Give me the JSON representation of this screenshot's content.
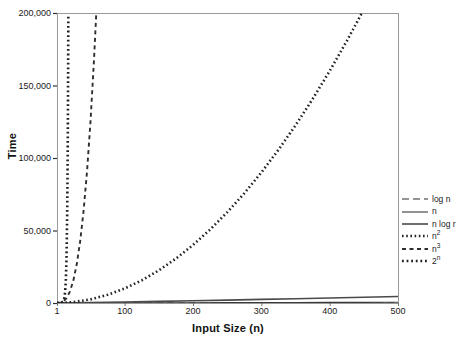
{
  "chart_data": {
    "type": "line",
    "title": "",
    "xlabel": "Input Size (n)",
    "ylabel": "Time",
    "xlim": [
      1,
      500
    ],
    "ylim": [
      0,
      200000
    ],
    "grid": false,
    "legend_position": "right",
    "x_ticks": [
      "1",
      "100",
      "200",
      "300",
      "400",
      "500"
    ],
    "x_tick_values": [
      1,
      100,
      200,
      300,
      400,
      500
    ],
    "y_ticks": [
      "0",
      "50,000",
      "100,000",
      "150,000",
      "200,000"
    ],
    "y_tick_values": [
      0,
      50000,
      100000,
      150000,
      200000
    ],
    "series": [
      {
        "name": "log n",
        "label_base": "log n",
        "label_sup": "",
        "style": "dashed-long",
        "dasharray": "7,4",
        "width": 1.2,
        "color": "#2b2b2b",
        "x": [
          1,
          10,
          25,
          50,
          100,
          150,
          200,
          250,
          300,
          350,
          400,
          450,
          500
        ],
        "y": [
          0,
          2,
          3,
          4,
          5,
          5,
          5,
          6,
          6,
          6,
          6,
          6,
          6
        ]
      },
      {
        "name": "n",
        "label_base": "n",
        "label_sup": "",
        "style": "solid",
        "dasharray": "",
        "width": 1.1,
        "color": "#3a3a3a",
        "x": [
          1,
          50,
          100,
          150,
          200,
          250,
          300,
          350,
          400,
          450,
          500
        ],
        "y": [
          1,
          50,
          100,
          150,
          200,
          250,
          300,
          350,
          400,
          450,
          500
        ]
      },
      {
        "name": "n log r",
        "label_base": "n log r",
        "label_sup": "",
        "style": "solid-thick",
        "dasharray": "",
        "width": 1.6,
        "color": "#4a4a4a",
        "x": [
          1,
          50,
          100,
          150,
          200,
          250,
          300,
          350,
          400,
          450,
          500
        ],
        "y": [
          0,
          282,
          664,
          1087,
          1535,
          2000,
          2478,
          2967,
          3466,
          3972,
          4484
        ]
      },
      {
        "name": "n2",
        "label_base": "n",
        "label_sup": "2",
        "style": "dotted-fine",
        "dasharray": "1.6,2.6",
        "width": 2.6,
        "color": "#242424",
        "x": [
          1,
          25,
          50,
          75,
          100,
          125,
          150,
          175,
          200,
          225,
          250,
          275,
          300,
          325,
          350,
          375,
          400,
          425,
          447
        ],
        "y": [
          1,
          625,
          2500,
          5625,
          10000,
          15625,
          22500,
          30625,
          40000,
          50625,
          62500,
          75625,
          90000,
          105625,
          122500,
          140625,
          160000,
          180625,
          199809
        ]
      },
      {
        "name": "n3",
        "label_base": "n",
        "label_sup": "3",
        "style": "dashed-med",
        "dasharray": "4,3.5",
        "width": 1.9,
        "color": "#2e2e2e",
        "x": [
          1,
          5,
          10,
          15,
          20,
          25,
          30,
          35,
          40,
          45,
          50,
          55,
          58.5
        ],
        "y": [
          1,
          125,
          1000,
          3375,
          8000,
          15625,
          27000,
          42875,
          64000,
          91125,
          125000,
          166375,
          200202
        ]
      },
      {
        "name": "2n",
        "label_base": "2",
        "label_sup": "n",
        "style": "dotted",
        "dasharray": "1.8,2.8",
        "width": 2.6,
        "color": "#1f1f1f",
        "x": [
          1,
          2,
          4,
          6,
          8,
          10,
          11,
          12,
          13,
          14,
          15,
          16,
          16.7,
          17,
          17.3,
          17.6
        ],
        "y": [
          2,
          4,
          16,
          64,
          256,
          1024,
          2048,
          4096,
          8192,
          16384,
          32768,
          65536,
          106496,
          131072,
          161243,
          198668
        ]
      }
    ]
  },
  "plot": {
    "left_px": 57,
    "right_px": 398,
    "top_px": 13,
    "bottom_px": 303,
    "border_color": "#9a9a9a",
    "background": "#ffffff"
  }
}
